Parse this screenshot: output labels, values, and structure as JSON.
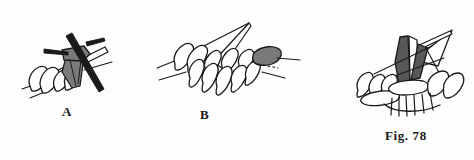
{
  "plate": {
    "kind": "instructional-line-illustration",
    "subject": "knitting-stitch-steps",
    "background_color": "#fdfdfd",
    "ink_color": "#1a1a1a",
    "fill_white": "#ffffff",
    "fill_mid_grey": "#7a7a7a",
    "fill_dark_grey": "#585858"
  },
  "labels": {
    "a": "A",
    "b": "B",
    "caption": "Fig. 78"
  },
  "figures": [
    {
      "id": "figure-a",
      "label": "A",
      "description": "Knitting needle crossing a row of stitches with a grey loop being drawn through",
      "elements": [
        "right-hand-needle",
        "left-hand-needle",
        "white-stitch-loops",
        "grey-pulled-loop",
        "working-yarn-strand"
      ]
    },
    {
      "id": "figure-b",
      "label": "B",
      "description": "Row of chained stitches on needle with a grey loop at the right end and dotted guide line",
      "elements": [
        "needle-with-point",
        "white-stitch-loops",
        "grey-loop",
        "dotted-guide-line",
        "yarn-strand"
      ]
    },
    {
      "id": "figure-c",
      "label": "",
      "description": "Completed stitch group with dark grey hook shapes and hanging fringe strands",
      "elements": [
        "needle-point",
        "dark-grey-hook",
        "white-stitch-loops",
        "hanging-strands"
      ]
    }
  ]
}
